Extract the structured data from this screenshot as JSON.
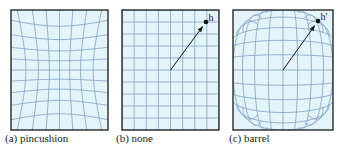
{
  "figure": {
    "grid": {
      "columns": 8,
      "rows": 10
    },
    "colors": {
      "fill": "#e4f4fb",
      "grid_line": "#7f9fc4",
      "border": "#1a1a1a",
      "arrow": "#111111"
    },
    "panels": [
      {
        "id": "a",
        "caption": "(a) pincushion",
        "distortion": "pincushion",
        "point_label": ""
      },
      {
        "id": "b",
        "caption": "(b) none",
        "distortion": "none",
        "point_label": "h"
      },
      {
        "id": "c",
        "caption": "(c) barrel",
        "distortion": "barrel",
        "point_label": "h'"
      }
    ]
  }
}
